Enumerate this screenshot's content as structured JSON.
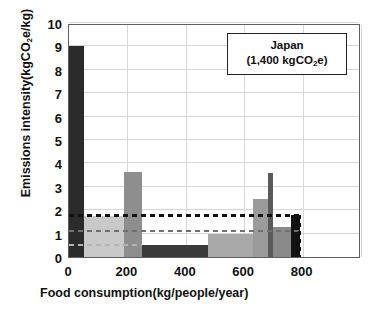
{
  "chart_data": {
    "type": "bar",
    "title": "",
    "xlabel": "Food consumption(kg/people/year)",
    "ylabel": "Emissions intensity(kgCO2e/kg)",
    "ylabel_parts": {
      "pre": "Emissions intensity(kgCO",
      "sub": "2",
      "post": "e/kg)"
    },
    "xlim": [
      0,
      1000
    ],
    "ylim": [
      0,
      10
    ],
    "grid": true,
    "legend_position": "top-right",
    "xticks": [
      "0",
      "200",
      "400",
      "600",
      "800"
    ],
    "xtick_values": [
      0,
      200,
      400,
      600,
      800
    ],
    "yticks": [
      "0",
      "1",
      "2",
      "3",
      "4",
      "5",
      "6",
      "7",
      "8",
      "9",
      "10"
    ],
    "ytick_values": [
      0,
      1,
      2,
      3,
      4,
      5,
      6,
      7,
      8,
      9,
      10
    ],
    "annotation": {
      "line1": "Japan",
      "line2_pre": "(1,400 kgCO",
      "line2_sub": "2",
      "line2_post": "e)"
    },
    "bars": [
      {
        "name": "beef",
        "x0": 0,
        "x1": 50,
        "value": 9.0,
        "color": "#2b2b2b"
      },
      {
        "name": "dairy",
        "x0": 50,
        "x1": 190,
        "value": 1.75,
        "color": "#c9c9c9"
      },
      {
        "name": "rice",
        "x0": 190,
        "x1": 250,
        "value": 3.65,
        "color": "#8e8e8e"
      },
      {
        "name": "pork",
        "x0": 250,
        "x1": 475,
        "value": 0.5,
        "color": "#3a3a3a"
      },
      {
        "name": "vegetables",
        "x0": 475,
        "x1": 630,
        "value": 1.0,
        "color": "#a8a8a8"
      },
      {
        "name": "fish",
        "x0": 630,
        "x1": 680,
        "value": 2.5,
        "color": "#9b9b9b"
      },
      {
        "name": "poultry",
        "x0": 680,
        "x1": 700,
        "value": 3.6,
        "color": "#5a5a5a"
      },
      {
        "name": "fruit",
        "x0": 700,
        "x1": 760,
        "value": 1.3,
        "color": "#8a8a8a"
      },
      {
        "name": "eggs",
        "x0": 760,
        "x1": 790,
        "value": 1.8,
        "color": "#111111"
      }
    ],
    "reference_lines": [
      {
        "name": "overall-average",
        "value": 1.78,
        "color": "#111111",
        "width": 3.0,
        "x_end": 790
      },
      {
        "name": "mid-average",
        "value": 1.1,
        "color": "#6f6f6f",
        "width": 1.6,
        "x_end": 790
      },
      {
        "name": "low-average",
        "value": 0.5,
        "color": "#b4b4b4",
        "width": 1.8,
        "x_end": 250
      }
    ],
    "vertical_marker": {
      "name": "japan-total-marker",
      "x": 790,
      "y0": 0,
      "y1": 1.8,
      "color": "#111111"
    }
  }
}
